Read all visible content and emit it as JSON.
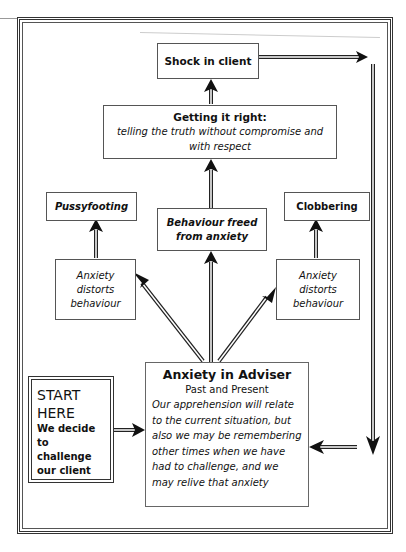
{
  "diagram": {
    "nodes": {
      "shock": {
        "label": "Shock in client"
      },
      "getting_right": {
        "title": "Getting it right:",
        "subtitle": "telling the truth without compromise and with respect"
      },
      "pussyfooting": {
        "label": "Pussyfooting"
      },
      "behaviour_freed": {
        "line1": "Behaviour freed",
        "line2": "from anxiety"
      },
      "clobbering": {
        "label": "Clobbering"
      },
      "distort_left": {
        "line1": "Anxiety",
        "line2": "distorts",
        "line3": "behaviour"
      },
      "distort_right": {
        "line1": "Anxiety",
        "line2": "distorts",
        "line3": "behaviour"
      },
      "start": {
        "title1": "START",
        "title2": "HERE",
        "line1": "We decide",
        "line2": "to challenge",
        "line3": "our client"
      },
      "anxiety_adviser": {
        "title": "Anxiety in Adviser",
        "subtitle": "Past and Present",
        "body": "Our apprehension will relate to the current situation, but also we may be remembering other times when we have had to challenge, and we may relive that anxiety"
      }
    },
    "edges": [
      {
        "from": "start",
        "to": "anxiety_adviser"
      },
      {
        "from": "anxiety_adviser",
        "to": "distort_left"
      },
      {
        "from": "anxiety_adviser",
        "to": "behaviour_freed"
      },
      {
        "from": "anxiety_adviser",
        "to": "distort_right"
      },
      {
        "from": "distort_left",
        "to": "pussyfooting"
      },
      {
        "from": "distort_right",
        "to": "clobbering"
      },
      {
        "from": "behaviour_freed",
        "to": "getting_right"
      },
      {
        "from": "getting_right",
        "to": "shock"
      },
      {
        "from": "shock",
        "to": "anxiety_adviser",
        "via": "right-side loop"
      }
    ],
    "colors": {
      "line": "#222222",
      "box_border": "#555555",
      "background": "#ffffff"
    }
  }
}
